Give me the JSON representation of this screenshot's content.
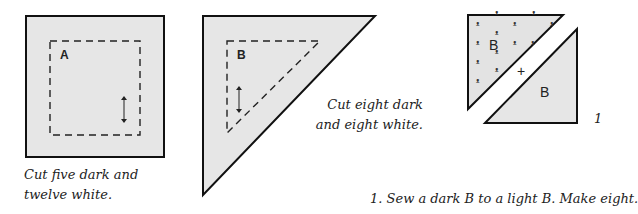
{
  "figures": {
    "square_a": {
      "label": "A",
      "caption": "Cut five dark and twelve white."
    },
    "triangle_b": {
      "label": "B",
      "caption_line1": "Cut eight dark",
      "caption_line2": "and eight white."
    },
    "assembly": {
      "dark_label": "B",
      "light_label": "B",
      "join_symbol": "+",
      "step_number": "1"
    }
  },
  "instructions": {
    "step1": "1. Sew a dark B to a light B. Make eight."
  },
  "colors": {
    "fill": "#e6e6e6",
    "outline": "#111111"
  }
}
